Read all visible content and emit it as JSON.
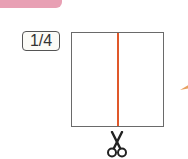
{
  "header": {
    "bar_color": "#e8a0b4"
  },
  "badge": {
    "fraction": "1/4"
  },
  "diagram": {
    "square_border_color": "#6a6a6a",
    "cut_line_color": "#e0582a",
    "cut_icon": "scissors-icon"
  },
  "edge_decoration": {
    "icon": "pencil-tip-icon",
    "color": "#e8a060"
  }
}
